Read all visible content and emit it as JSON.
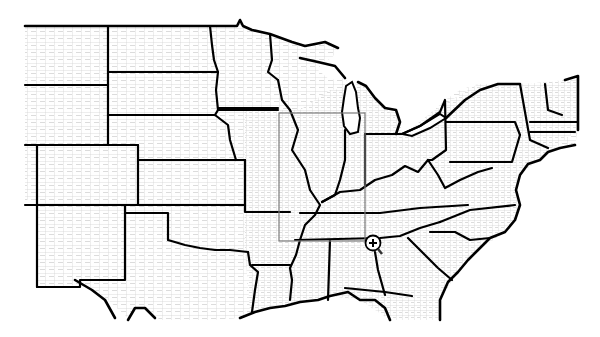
{
  "map": {
    "title": "United States county boundaries map",
    "region": "Central and Eastern United States",
    "background_color": "#ffffff",
    "county_line_color": "#c8c8c8",
    "state_line_color": "#000000",
    "selection_rect_color": "#7a7a7a",
    "layers": [
      "county-boundaries",
      "state-boundaries"
    ],
    "states_visible": [
      "Montana",
      "Wyoming",
      "Colorado",
      "New Mexico",
      "North Dakota",
      "South Dakota",
      "Nebraska",
      "Kansas",
      "Oklahoma",
      "Texas",
      "Minnesota",
      "Iowa",
      "Missouri",
      "Arkansas",
      "Louisiana",
      "Wisconsin",
      "Illinois",
      "Michigan",
      "Indiana",
      "Ohio",
      "Kentucky",
      "Tennessee",
      "Mississippi",
      "Alabama",
      "Georgia",
      "Florida",
      "South Carolina",
      "North Carolina",
      "Virginia",
      "West Virginia",
      "Maryland",
      "Delaware",
      "Pennsylvania",
      "New Jersey",
      "New York",
      "Connecticut",
      "Rhode Island",
      "Massachusetts",
      "Vermont",
      "New Hampshire"
    ],
    "selection_box": {
      "x": 279,
      "y": 113,
      "width": 86,
      "height": 128
    },
    "cursor": {
      "type": "zoom-in-magnifier",
      "x": 373,
      "y": 243,
      "glyph": "+"
    }
  }
}
